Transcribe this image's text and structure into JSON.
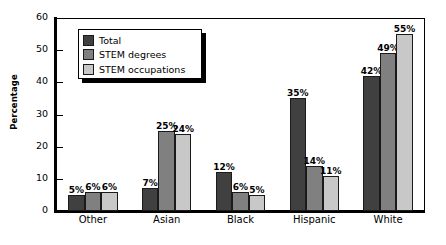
{
  "chart_data": {
    "type": "bar",
    "title": "",
    "xlabel": "",
    "ylabel": "Percentage",
    "ylim": [
      0,
      60
    ],
    "yticks": [
      0,
      10,
      20,
      30,
      40,
      50,
      60
    ],
    "ytick_labels": [
      "0",
      "10",
      "20",
      "30",
      "40",
      "50",
      "60"
    ],
    "grid": false,
    "legend_position": "upper-left-inside",
    "categories": [
      "Other",
      "Asian",
      "Black",
      "Hispanic",
      "White"
    ],
    "series": [
      {
        "name": "Total",
        "color": "#404040",
        "values": [
          5,
          7,
          12,
          35,
          42
        ],
        "labels": [
          "5%",
          "7%",
          "12%",
          "35%",
          "42%"
        ]
      },
      {
        "name": "STEM degrees",
        "color": "#808080",
        "values": [
          6,
          25,
          6,
          14,
          49
        ],
        "labels": [
          "6%",
          "25%",
          "6%",
          "14%",
          "49%"
        ]
      },
      {
        "name": "STEM occupations",
        "color": "#c8c8c8",
        "values": [
          6,
          24,
          5,
          11,
          55
        ],
        "labels": [
          "6%",
          "24%",
          "5%",
          "11%",
          "55%"
        ]
      }
    ]
  }
}
